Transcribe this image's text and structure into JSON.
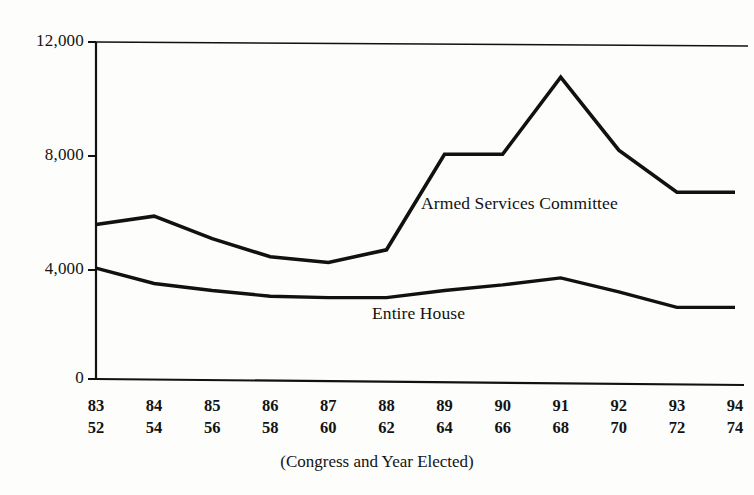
{
  "chart_data": {
    "type": "line",
    "title": "",
    "subtitle": "",
    "xlabel": "(Congress and Year Elected)",
    "ylabel": "",
    "grid": false,
    "legend_position": "inline-labels",
    "ylim": [
      0,
      12000
    ],
    "yticks": [
      "0",
      "4,000",
      "8,000",
      "12,000"
    ],
    "ytick_values": [
      0,
      4000,
      8000,
      12000
    ],
    "categories": [
      "83",
      "84",
      "85",
      "86",
      "87",
      "88",
      "89",
      "90",
      "91",
      "92",
      "93",
      "94"
    ],
    "x_sublabels": [
      "52",
      "54",
      "56",
      "58",
      "60",
      "62",
      "64",
      "66",
      "68",
      "70",
      "72",
      "74"
    ],
    "series": [
      {
        "name": "Armed Services Committee",
        "values": [
          5500,
          5800,
          5000,
          4350,
          4150,
          4600,
          8000,
          8000,
          10750,
          8150,
          6650,
          6650
        ]
      },
      {
        "name": "Entire House",
        "values": [
          3950,
          3400,
          3150,
          2950,
          2900,
          2900,
          3150,
          3350,
          3600,
          3100,
          2550,
          2550
        ]
      }
    ],
    "annotations": [
      {
        "text": "Armed Services Committee",
        "x": 421,
        "y": 205
      },
      {
        "text": "Entire House",
        "x": 372,
        "y": 315
      }
    ]
  },
  "axis": {
    "x_caption": "(Congress and Year Elected)"
  },
  "icons": {
    "chart_line_icon": "line-chart-icon"
  },
  "colors": {
    "line": "#111111",
    "axis": "#111111",
    "background": "#fdfdfc",
    "text": "#131313"
  }
}
